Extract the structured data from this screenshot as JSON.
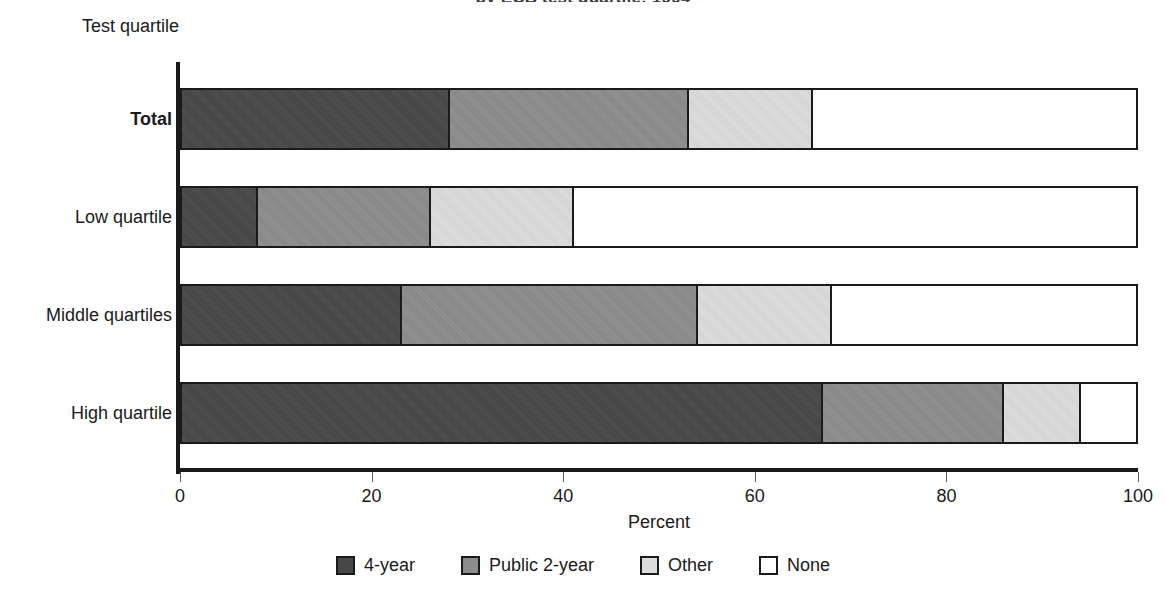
{
  "chart_data": {
    "type": "bar",
    "orientation": "horizontal",
    "stacked": true,
    "normalized": true,
    "title": "by ECB test quartile: 1994",
    "xlabel": "Percent",
    "ylabel": "Test quartile",
    "xlim": [
      0,
      100
    ],
    "xticks": [
      0,
      20,
      40,
      60,
      80,
      100
    ],
    "xtick_labels": [
      "0",
      "20",
      "40",
      "60",
      "80",
      "100"
    ],
    "grid": false,
    "legend_position": "bottom",
    "categories": [
      "Total",
      "Low quartile",
      "Middle quartiles",
      "High quartile"
    ],
    "series": [
      {
        "name": "4-year",
        "color": "#474747",
        "values": [
          28,
          8,
          23,
          67
        ]
      },
      {
        "name": "Public 2-year",
        "color": "#8c8c8c",
        "values": [
          25,
          18,
          31,
          19
        ]
      },
      {
        "name": "Other",
        "color": "#dcdcdc",
        "values": [
          13,
          15,
          14,
          8
        ]
      },
      {
        "name": "None",
        "color": "#ffffff",
        "values": [
          34,
          59,
          32,
          6
        ]
      }
    ]
  },
  "axes": {
    "y_axis_title": "Test quartile",
    "x_axis_title": "Percent",
    "x_tick_labels": [
      "0",
      "20",
      "40",
      "60",
      "80",
      "100"
    ]
  },
  "categories": [
    {
      "label": "Total",
      "bold": true
    },
    {
      "label": "Low quartile",
      "bold": false
    },
    {
      "label": "Middle quartiles",
      "bold": false
    },
    {
      "label": "High quartile",
      "bold": false
    }
  ],
  "legend": {
    "items": [
      {
        "label": "4-year",
        "color": "#474747"
      },
      {
        "label": "Public 2-year",
        "color": "#8c8c8c"
      },
      {
        "label": "Other",
        "color": "#dcdcdc"
      },
      {
        "label": "None",
        "color": "#ffffff"
      }
    ]
  },
  "title": {
    "text": "by ECB test quartile: 1994"
  }
}
